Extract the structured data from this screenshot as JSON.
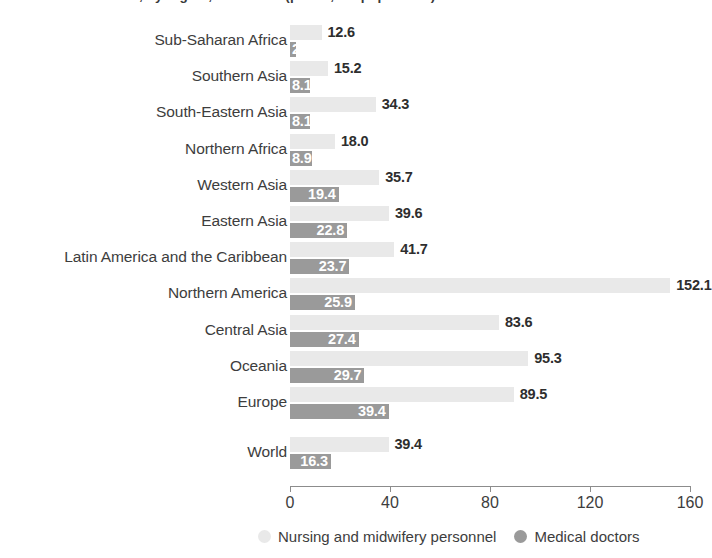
{
  "title": "Health-care workers, by region, 2013-2018 (per 10,000 population)",
  "axis": {
    "ticks": [
      "0",
      "40",
      "80",
      "120",
      "160"
    ],
    "tick_values": [
      0,
      40,
      80,
      120,
      160
    ],
    "min": 0,
    "max": 160
  },
  "legend": [
    {
      "label": "Nursing and midwifery personnel",
      "color": "#e9e9e9",
      "name": "nursing-and-midwifery-personnel"
    },
    {
      "label": "Medical doctors",
      "color": "#9a9a9a",
      "name": "medical-doctors"
    }
  ],
  "colors": {
    "nursing": "#e9e9e9",
    "doctors": "#9a9a9a",
    "text": "#3a3a3a",
    "axis": "#8c8c8c"
  },
  "chart_data": {
    "type": "bar",
    "orientation": "horizontal",
    "title": "Health-care workers, by region, 2013-2018 (per 10,000 population)",
    "xlabel": "",
    "ylabel": "",
    "xlim": [
      0,
      160
    ],
    "grid": false,
    "legend_position": "bottom",
    "categories": [
      "Sub-Saharan Africa",
      "Southern Asia",
      "South-Eastern Asia",
      "Northern Africa",
      "Western Asia",
      "Eastern Asia",
      "Latin America and the Caribbean",
      "Northern America",
      "Central Asia",
      "Oceania",
      "Europe",
      "World"
    ],
    "series": [
      {
        "name": "Nursing and midwifery personnel",
        "color": "#e9e9e9",
        "values": [
          12.6,
          15.2,
          34.3,
          18.0,
          35.7,
          39.6,
          41.7,
          152.1,
          83.6,
          95.3,
          89.5,
          39.4
        ],
        "labels": [
          "12.6",
          "15.2",
          "34.3",
          "18.0",
          "35.7",
          "39.6",
          "41.7",
          "152.1",
          "83.6",
          "95.3",
          "89.5",
          "39.4"
        ]
      },
      {
        "name": "Medical doctors",
        "color": "#9a9a9a",
        "values": [
          2.3,
          8.1,
          8.1,
          8.9,
          19.4,
          22.8,
          23.7,
          25.9,
          27.4,
          29.7,
          39.4,
          16.3
        ],
        "labels": [
          "2.3",
          "8.1",
          "8.1",
          "8.9",
          "19.4",
          "22.8",
          "23.7",
          "25.9",
          "27.4",
          "29.7",
          "39.4",
          "16.3"
        ]
      }
    ]
  }
}
